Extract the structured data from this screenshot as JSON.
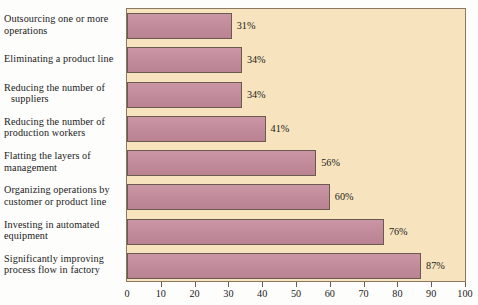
{
  "chart_data": {
    "type": "bar",
    "orientation": "horizontal",
    "title": "",
    "subtitle": "",
    "xlabel": "",
    "ylabel": "",
    "xlim": [
      0,
      100
    ],
    "xticks": [
      0,
      10,
      20,
      30,
      40,
      50,
      60,
      70,
      80,
      90,
      100
    ],
    "xtick_labels": [
      "0",
      "10",
      "20",
      "30",
      "40",
      "50",
      "60",
      "70",
      "80",
      "90",
      "100"
    ],
    "grid": false,
    "legend": null,
    "value_suffix": "%",
    "categories": [
      "Outsourcing one or more operations",
      "Eliminating a product line",
      "Reducing the number of suppliers",
      "Reducing the number of production workers",
      "Flatting the layers of management",
      "Organizing operations by customer or product line",
      "Investing in automated equipment",
      "Significantly improving process flow in factory"
    ],
    "values": [
      31,
      34,
      34,
      41,
      56,
      60,
      76,
      87
    ],
    "data_labels": [
      "31%",
      "34%",
      "34%",
      "41%",
      "56%",
      "60%",
      "76%",
      "87%"
    ],
    "bars": [
      {
        "label_line1": "Outsourcing one or more",
        "label_line2": "operations",
        "indent_line2": false,
        "value": 31,
        "data_label": "31%"
      },
      {
        "label_line1": "Eliminating a product line",
        "label_line2": "",
        "indent_line2": false,
        "value": 34,
        "data_label": "34%"
      },
      {
        "label_line1": "Reducing the number of",
        "label_line2": "suppliers",
        "indent_line2": true,
        "value": 34,
        "data_label": "34%"
      },
      {
        "label_line1": "Reducing the number of",
        "label_line2": "production workers",
        "indent_line2": false,
        "value": 41,
        "data_label": "41%"
      },
      {
        "label_line1": "Flatting the layers of",
        "label_line2": "management",
        "indent_line2": false,
        "value": 56,
        "data_label": "56%"
      },
      {
        "label_line1": "Organizing operations by",
        "label_line2": "customer or product line",
        "indent_line2": false,
        "value": 60,
        "data_label": "60%"
      },
      {
        "label_line1": "Investing in automated",
        "label_line2": "equipment",
        "indent_line2": false,
        "value": 76,
        "data_label": "76%"
      },
      {
        "label_line1": "Significantly improving",
        "label_line2": "process flow in factory",
        "indent_line2": false,
        "value": 87,
        "data_label": "87%"
      }
    ]
  },
  "colors": {
    "bar_fill": "#c4899a",
    "bar_edge": "#6b5a50",
    "plot_background": "#f7e3bd",
    "plot_border": "#8a7860",
    "page_background": "#fdfdfb",
    "text": "#1b1b1b"
  }
}
